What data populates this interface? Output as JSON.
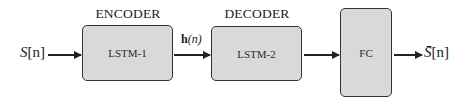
{
  "diagram": {
    "input_label": {
      "var": "S",
      "index": "[n]"
    },
    "encoder": {
      "title": "ENCODER",
      "block": "LSTM-1"
    },
    "hidden_label": {
      "var": "h",
      "arg": "(n)"
    },
    "decoder": {
      "title": "DECODER",
      "block": "LSTM-2"
    },
    "fc": {
      "block": "FC"
    },
    "output_label": {
      "var": "S̄",
      "index": "[n]"
    },
    "colors": {
      "box_fill": "#d9d9d9",
      "stroke": "#333333"
    }
  }
}
